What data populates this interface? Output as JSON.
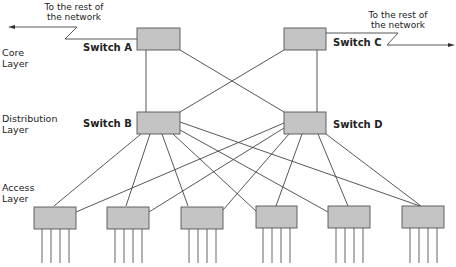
{
  "layers": [
    {
      "id": "core",
      "line1": "Core",
      "line2": "Layer"
    },
    {
      "id": "distribution",
      "line1": "Distribution",
      "line2": "Layer"
    },
    {
      "id": "access",
      "line1": "Access",
      "line2": "Layer"
    }
  ],
  "switches": {
    "a": {
      "label": "Switch A"
    },
    "b": {
      "label": "Switch B"
    },
    "c": {
      "label": "Switch C"
    },
    "d": {
      "label": "Switch D"
    }
  },
  "uplinks": {
    "left": {
      "line1": "To the rest of",
      "line2": "the network"
    },
    "right": {
      "line1": "To the rest of",
      "line2": "the network"
    }
  },
  "access_switch_count": 6,
  "ports_per_access_switch": 4,
  "colors": {
    "switch_fill": "#c4c4c4",
    "switch_stroke": "#555555",
    "line": "#444444"
  }
}
